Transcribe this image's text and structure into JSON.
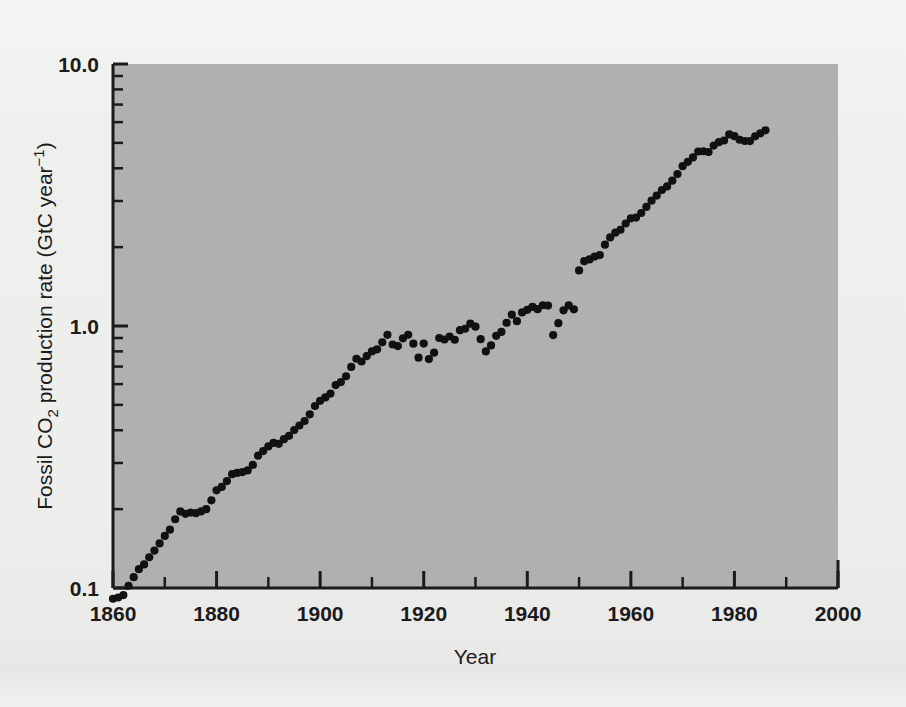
{
  "figure": {
    "background_color": "#efefed",
    "plot_background_color": "#b0b0b0",
    "axis_color": "#1b1b1b",
    "marker_color": "#111111"
  },
  "axes": {
    "x": {
      "title": "Year",
      "major_ticks": [
        "1860",
        "1880",
        "1900",
        "1920",
        "1940",
        "1960",
        "1980",
        "2000"
      ],
      "major_values": [
        1860,
        1880,
        1900,
        1920,
        1940,
        1960,
        1980,
        2000
      ],
      "minor_values": [
        1870,
        1890,
        1910,
        1930,
        1950,
        1970,
        1990
      ],
      "range": [
        1860,
        2000
      ]
    },
    "y": {
      "title_parts": {
        "lead": "Fossil CO",
        "sub": "2",
        "mid": " production rate (GtC year",
        "sup": "−1",
        "tail": ")"
      },
      "title_plain": "Fossil CO2 production rate (GtC year-1)",
      "major_ticks": [
        "0.1",
        "1.0",
        "10.0"
      ],
      "major_values": [
        0.1,
        1.0,
        10.0
      ],
      "scale": "log",
      "range": [
        0.1,
        10.0
      ]
    }
  },
  "chart_data": {
    "type": "scatter",
    "title": "",
    "subtitle": "",
    "xlabel": "Year",
    "ylabel": "Fossil CO2 production rate (GtC year-1)",
    "xlim": [
      1860,
      2000
    ],
    "ylim": [
      0.1,
      10.0
    ],
    "yscale": "log",
    "grid": false,
    "legend": "none",
    "marker": "filled-circle",
    "series": [
      {
        "name": "Fossil CO2 production rate",
        "units": "GtC year-1",
        "x": [
          1860,
          1861,
          1862,
          1863,
          1864,
          1865,
          1866,
          1867,
          1868,
          1869,
          1870,
          1871,
          1872,
          1873,
          1874,
          1875,
          1876,
          1877,
          1878,
          1879,
          1880,
          1881,
          1882,
          1883,
          1884,
          1885,
          1886,
          1887,
          1888,
          1889,
          1890,
          1891,
          1892,
          1893,
          1894,
          1895,
          1896,
          1897,
          1898,
          1899,
          1900,
          1901,
          1902,
          1903,
          1904,
          1905,
          1906,
          1907,
          1908,
          1909,
          1910,
          1911,
          1912,
          1913,
          1914,
          1915,
          1916,
          1917,
          1918,
          1919,
          1920,
          1921,
          1922,
          1923,
          1924,
          1925,
          1926,
          1927,
          1928,
          1929,
          1930,
          1931,
          1932,
          1933,
          1934,
          1935,
          1936,
          1937,
          1938,
          1939,
          1940,
          1941,
          1942,
          1943,
          1944,
          1945,
          1946,
          1947,
          1948,
          1949,
          1950,
          1951,
          1952,
          1953,
          1954,
          1955,
          1956,
          1957,
          1958,
          1959,
          1960,
          1961,
          1962,
          1963,
          1964,
          1965,
          1966,
          1967,
          1968,
          1969,
          1970,
          1971,
          1972,
          1973,
          1974,
          1975,
          1976,
          1977,
          1978,
          1979,
          1980,
          1981,
          1982,
          1983,
          1984,
          1985,
          1986
        ],
        "y": [
          0.091,
          0.092,
          0.094,
          0.102,
          0.11,
          0.118,
          0.123,
          0.131,
          0.139,
          0.148,
          0.158,
          0.167,
          0.183,
          0.196,
          0.192,
          0.194,
          0.193,
          0.196,
          0.2,
          0.216,
          0.236,
          0.243,
          0.256,
          0.272,
          0.275,
          0.277,
          0.281,
          0.295,
          0.32,
          0.333,
          0.347,
          0.358,
          0.355,
          0.37,
          0.381,
          0.401,
          0.417,
          0.434,
          0.46,
          0.495,
          0.518,
          0.534,
          0.552,
          0.595,
          0.611,
          0.643,
          0.698,
          0.75,
          0.732,
          0.768,
          0.8,
          0.815,
          0.866,
          0.925,
          0.85,
          0.838,
          0.897,
          0.926,
          0.856,
          0.757,
          0.857,
          0.748,
          0.791,
          0.9,
          0.888,
          0.912,
          0.886,
          0.964,
          0.976,
          1.021,
          0.994,
          0.891,
          0.8,
          0.843,
          0.917,
          0.949,
          1.029,
          1.105,
          1.043,
          1.127,
          1.153,
          1.183,
          1.159,
          1.2,
          1.197,
          0.923,
          1.025,
          1.148,
          1.198,
          1.158,
          1.63,
          1.767,
          1.795,
          1.841,
          1.865,
          2.043,
          2.179,
          2.27,
          2.33,
          2.462,
          2.577,
          2.594,
          2.7,
          2.848,
          3.008,
          3.145,
          3.305,
          3.411,
          3.588,
          3.8,
          4.075,
          4.231,
          4.399,
          4.635,
          4.644,
          4.615,
          4.883,
          5.029,
          5.105,
          5.387,
          5.302,
          5.138,
          5.082,
          5.081,
          5.297,
          5.439,
          5.584
        ]
      }
    ]
  }
}
